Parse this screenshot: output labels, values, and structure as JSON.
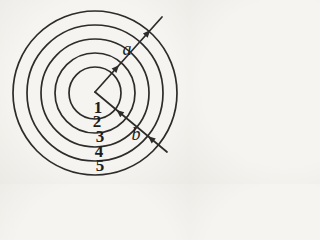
{
  "figure": {
    "background": "#f4f3ef",
    "stroke_color": "#2d2c2a",
    "stroke_width": 1.7,
    "text_color": "#1e1d1b"
  },
  "diagram": {
    "center": {
      "x": 95,
      "y": 93
    },
    "circles": [
      {
        "label": "1",
        "radius": 26,
        "label_x": 98,
        "label_y": 113
      },
      {
        "label": "2",
        "radius": 40,
        "label_x": 97,
        "label_y": 127
      },
      {
        "label": "3",
        "radius": 54,
        "label_x": 100,
        "label_y": 142
      },
      {
        "label": "4",
        "radius": 68,
        "label_x": 99,
        "label_y": 157
      },
      {
        "label": "5",
        "radius": 82,
        "label_x": 100,
        "label_y": 171
      }
    ],
    "arrows": [
      {
        "name": "a",
        "label": "a",
        "x1": 95,
        "y1": 92,
        "x2": 162,
        "y2": 17,
        "label_x": 127,
        "label_y": 55,
        "arrowheads": [
          {
            "t": 36,
            "points_to": "end"
          },
          {
            "t": 83,
            "points_to": "end"
          }
        ]
      },
      {
        "name": "b",
        "label": "b",
        "x1": 95,
        "y1": 92,
        "x2": 167,
        "y2": 152,
        "label_x": 136,
        "label_y": 140,
        "arrowheads": [
          {
            "t": 28,
            "points_to": "start"
          },
          {
            "t": 69,
            "points_to": "start"
          }
        ]
      }
    ]
  }
}
